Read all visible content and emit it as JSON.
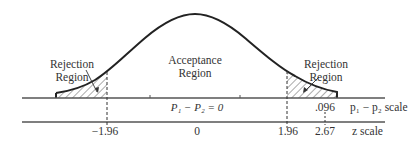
{
  "diagram": {
    "type": "normal-distribution-hypothesis-test",
    "labels": {
      "acceptance": [
        "Acceptance",
        "Region"
      ],
      "rejection_left": [
        "Rejection",
        "Region"
      ],
      "rejection_right": [
        "Rejection",
        "Region"
      ]
    },
    "center_label": "P₁ − P₂ = 0",
    "top_scale": {
      "name": "p₁ − p₂ scale",
      "marked_value": ".096"
    },
    "bottom_scale": {
      "name": "z scale",
      "ticks": [
        "−1.96",
        "0",
        "1.96",
        "2.67"
      ]
    },
    "critical_values": [
      -1.96,
      1.96
    ],
    "observed_z": 2.67,
    "observed_difference": 0.096,
    "colors": {
      "line": "#2a2a2a",
      "hatch": "#444444",
      "background": "#ffffff"
    }
  }
}
